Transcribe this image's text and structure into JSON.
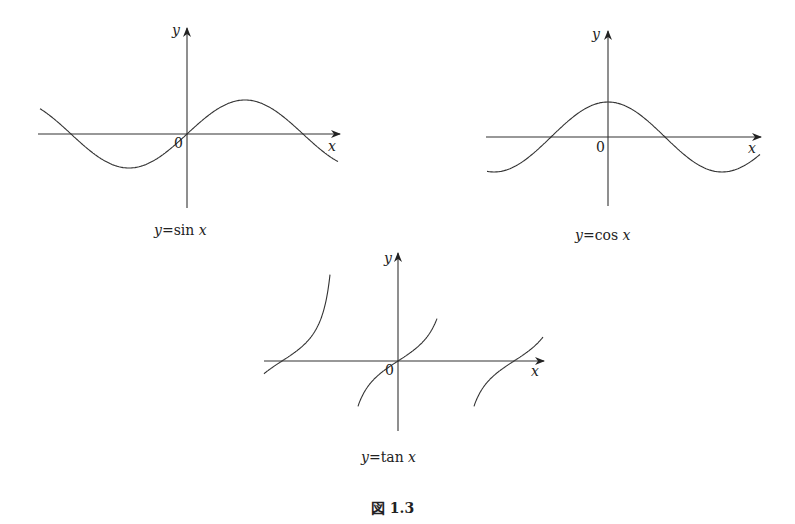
{
  "chart_data": [
    {
      "type": "line",
      "title": "",
      "caption": "y=sin x",
      "function": "sin",
      "xlabel": "x",
      "ylabel": "y",
      "origin_label": "0",
      "x_range_periods": [
        -1.27,
        1.31
      ],
      "y_range": [
        -1,
        1
      ],
      "grid": false,
      "series": [
        {
          "name": "y=sin x",
          "x": [
            -3.9,
            -3.1416,
            -1.5708,
            0,
            1.5708,
            3.1416,
            4.0
          ],
          "y": [
            0.69,
            0,
            -1,
            0,
            1,
            0,
            -0.76
          ]
        }
      ]
    },
    {
      "type": "line",
      "title": "",
      "caption": "y=cos x",
      "function": "cos",
      "xlabel": "x",
      "ylabel": "y",
      "origin_label": "0",
      "y_range": [
        -1,
        1
      ],
      "grid": false,
      "series": [
        {
          "name": "y=cos x",
          "x": [
            -3.2,
            -1.5708,
            0,
            1.5708,
            3.1416,
            3.9
          ],
          "y": [
            -1,
            0,
            1,
            0,
            -1,
            -0.73
          ]
        }
      ]
    },
    {
      "type": "line",
      "title": "",
      "caption": "y=tan x",
      "function": "tan",
      "xlabel": "x",
      "ylabel": "y",
      "origin_label": "0",
      "grid": false,
      "series": [
        {
          "name": "y=tan x",
          "x": [
            -3.1416,
            0,
            3.1416
          ],
          "y": [
            0,
            0,
            0
          ],
          "asymptotes": [
            -1.5708,
            1.5708
          ]
        }
      ]
    }
  ],
  "labels": {
    "sin": {
      "y": "y",
      "x": "x",
      "origin": "0",
      "caption_var": "y",
      "caption_eq": "=sin ",
      "caption_x": "x"
    },
    "cos": {
      "y": "y",
      "x": "x",
      "origin": "0",
      "caption_var": "y",
      "caption_eq": "=cos ",
      "caption_x": "x"
    },
    "tan": {
      "y": "y",
      "x": "x",
      "origin": "0",
      "caption_var": "y",
      "caption_eq": "=tan ",
      "caption_x": "x"
    }
  },
  "figure_caption": "図 1.3"
}
